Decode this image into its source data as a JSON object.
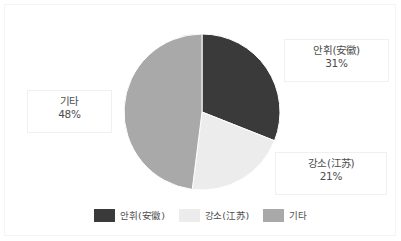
{
  "chart_data": {
    "type": "pie",
    "title": "",
    "labels": [
      "안휘(安徽)",
      "강소(江苏)",
      "기타"
    ],
    "values": [
      31,
      21,
      48
    ],
    "value_suffix": "%",
    "colors": [
      "#3a3a3a",
      "#ececec",
      "#a9a9a9"
    ],
    "start_angle_deg": 0,
    "direction": "clockwise",
    "legend_position": "bottom",
    "grid": false,
    "slices": [
      {
        "label": "안휘(安徽)",
        "value": 31,
        "display_value": "31%",
        "color": "#3a3a3a"
      },
      {
        "label": "강소(江苏)",
        "value": 21,
        "display_value": "21%",
        "color": "#ececec"
      },
      {
        "label": "기타",
        "value": 48,
        "display_value": "48%",
        "color": "#a9a9a9"
      }
    ]
  },
  "callouts": {
    "anhui": {
      "name": "안휘(安徽)",
      "value": "31%"
    },
    "gita": {
      "name": "기타",
      "value": "48%"
    },
    "jiangsu": {
      "name": "강소(江苏)",
      "value": "21%"
    }
  },
  "legend": {
    "items": [
      {
        "label": "안휘(安徽)",
        "color": "#3a3a3a"
      },
      {
        "label": "강소(江苏)",
        "color": "#ececec"
      },
      {
        "label": "기타",
        "color": "#a9a9a9"
      }
    ]
  }
}
